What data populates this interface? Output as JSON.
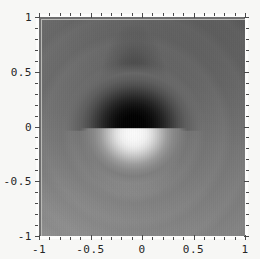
{
  "figure": {
    "title": "",
    "background_color": "#f7f7f5",
    "frame_color": "#fdfdfc",
    "tick_color": "#4a4a4a",
    "label_color": "#262626"
  },
  "chart_data": {
    "type": "heatmap",
    "title": "",
    "xlabel": "",
    "ylabel": "",
    "xlim": [
      -1,
      1
    ],
    "ylim": [
      -1,
      1
    ],
    "grid": false,
    "legend": "none",
    "colormap": "grayscale",
    "colormap_min_color": "#000000",
    "colormap_max_color": "#ffffff",
    "singularity": {
      "x": 0,
      "y": 0
    },
    "dark_lobe_center": {
      "x": 0.0,
      "y": 0.25,
      "value": 0.0
    },
    "light_lobe_center": {
      "x": 0.0,
      "y": -0.13,
      "value": 1.0
    },
    "background_value": 0.42,
    "x_ticks": [
      {
        "value": -1,
        "label": "-1"
      },
      {
        "value": -0.5,
        "label": "-0.5"
      },
      {
        "value": 0,
        "label": "0"
      },
      {
        "value": 0.5,
        "label": "0.5"
      },
      {
        "value": 1,
        "label": "1"
      }
    ],
    "y_ticks": [
      {
        "value": 1,
        "label": "1"
      },
      {
        "value": 0.5,
        "label": "0.5"
      },
      {
        "value": 0,
        "label": "0"
      },
      {
        "value": -0.5,
        "label": "-0.5"
      },
      {
        "value": -1,
        "label": "-1"
      }
    ],
    "x_minor_ticks": [
      -0.9,
      -0.8,
      -0.7,
      -0.6,
      -0.4,
      -0.3,
      -0.2,
      -0.1,
      0.1,
      0.2,
      0.3,
      0.4,
      0.6,
      0.7,
      0.8,
      0.9
    ],
    "y_minor_ticks": [
      -0.9,
      -0.8,
      -0.7,
      -0.6,
      -0.4,
      -0.3,
      -0.2,
      -0.1,
      0.1,
      0.2,
      0.3,
      0.4,
      0.6,
      0.7,
      0.8,
      0.9
    ]
  }
}
